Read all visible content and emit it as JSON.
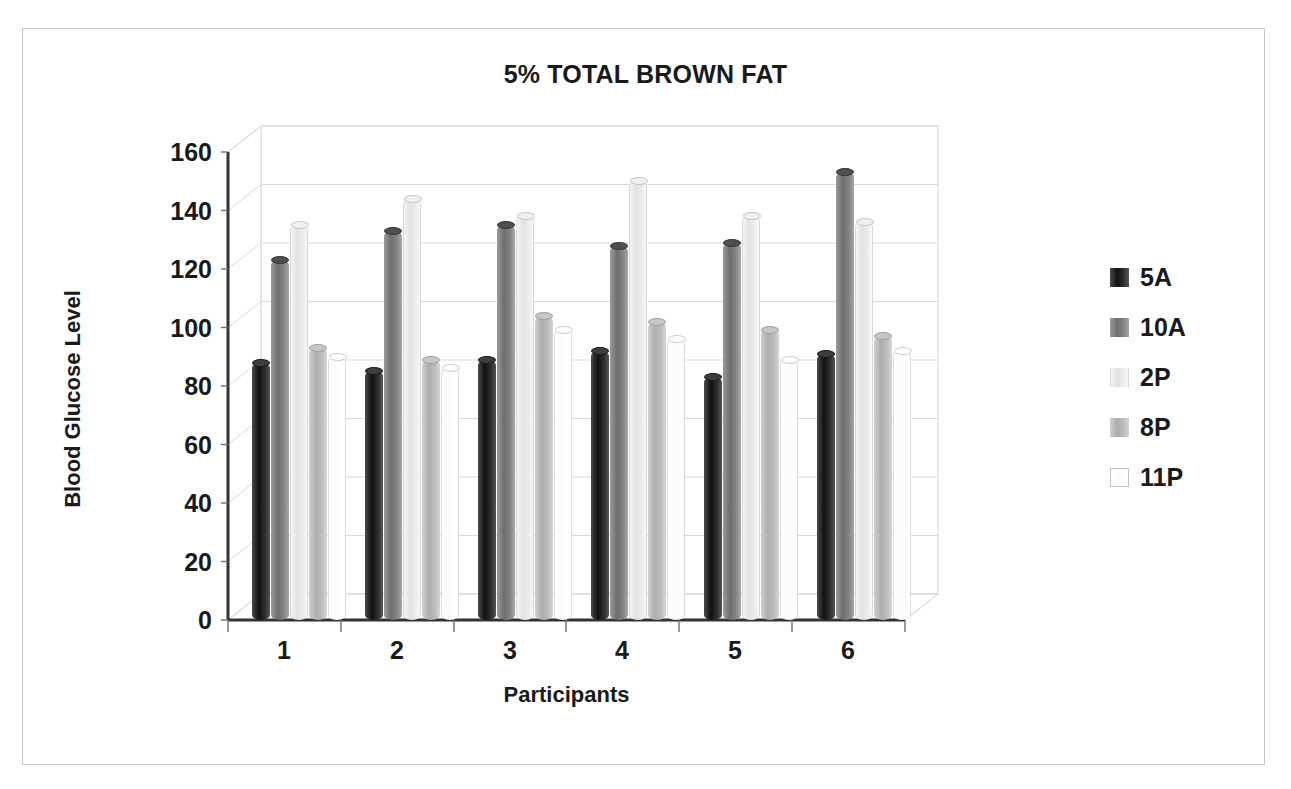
{
  "frame": {
    "border_color": "#c9c9c9"
  },
  "chart_data": {
    "type": "bar",
    "title": "5% TOTAL BROWN FAT",
    "xlabel": "Participants",
    "ylabel": "Blood Glucose Level",
    "ylim": [
      0,
      160
    ],
    "ytick_step": 20,
    "yticks": [
      160,
      140,
      120,
      100,
      80,
      60,
      40,
      20,
      0
    ],
    "categories": [
      "1",
      "2",
      "3",
      "4",
      "5",
      "6"
    ],
    "grid": true,
    "legend_position": "right",
    "bar_style": "3d-cylinder",
    "series": [
      {
        "name": "5A",
        "color": "#262626",
        "values": [
          88,
          85,
          89,
          92,
          83,
          91
        ]
      },
      {
        "name": "10A",
        "color": "#7d7d7d",
        "values": [
          123,
          133,
          135,
          128,
          129,
          153
        ]
      },
      {
        "name": "2P",
        "color": "#e8e8e8",
        "values": [
          135,
          144,
          138,
          150,
          138,
          136
        ]
      },
      {
        "name": "8P",
        "color": "#b8b8b8",
        "values": [
          93,
          89,
          104,
          102,
          99,
          97
        ]
      },
      {
        "name": "11P",
        "color": "#ffffff",
        "values": [
          90,
          86,
          99,
          96,
          89,
          92
        ]
      }
    ]
  }
}
